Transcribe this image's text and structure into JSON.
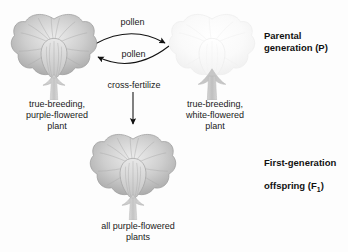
{
  "figure": {
    "background_color": "#fdfdfd",
    "text_color": "#1a1a1a"
  },
  "arrows": {
    "pollen_top_label": "pollen",
    "pollen_bottom_label": "pollen",
    "cross_fertilize_label": "cross-fertilize"
  },
  "nodes": {
    "purple_parent": {
      "icon": "pea-flower-purple",
      "caption": "true-breeding,\npurple-flowered\nplant",
      "petal_color": "#c9c9c9"
    },
    "white_parent": {
      "icon": "pea-flower-white",
      "caption": "true-breeding,\nwhite-flowered\nplant",
      "petal_color": "#f7f7f7"
    },
    "offspring": {
      "icon": "pea-flower-purple",
      "caption": "all purple-flowered\nplants",
      "petal_color": "#c9c9c9"
    }
  },
  "generations": {
    "parental": "Parental\ngeneration (P)",
    "f1_line1": "First-generation",
    "f1_line2_pre": "offspring (F",
    "f1_sub": "1",
    "f1_line2_post": ")"
  }
}
